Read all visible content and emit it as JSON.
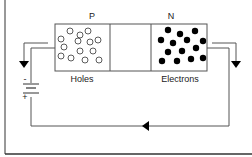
{
  "diagram": {
    "p_label": "P",
    "n_label": "N",
    "holes_label": "Holes",
    "electrons_label": "Electrons",
    "battery_minus": "-",
    "battery_plus": "+",
    "colors": {
      "line": "#555555",
      "frame": "#333333",
      "electron": "#000000",
      "hole_stroke": "#333333"
    }
  }
}
